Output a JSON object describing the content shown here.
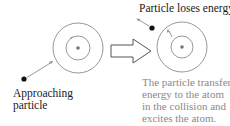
{
  "labels": {
    "approaching": [
      "Approaching",
      "particle"
    ],
    "loses_energy": "Particle loses energy"
  },
  "caption": {
    "lines": [
      "The particle transfers",
      "energy to the atom",
      "in the collision and",
      "excites the atom."
    ]
  },
  "colors": {
    "ring": "#8c8c8c",
    "nucleus": "#777777",
    "particle": "#111111",
    "arrow": "#999999",
    "caption_text": "#8a8a8a"
  }
}
